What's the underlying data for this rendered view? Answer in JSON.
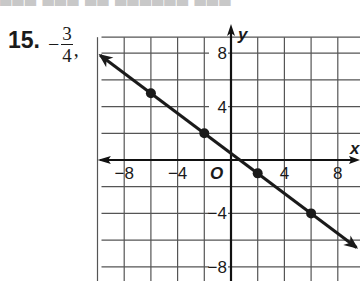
{
  "problem": {
    "number": "15.",
    "answer_sign": "−",
    "answer_numerator": "3",
    "answer_denominator": "4",
    "answer_punct": ","
  },
  "colors": {
    "line": "#1a1a1a",
    "grid": "#555555",
    "axis": "#111111"
  },
  "chart_data": {
    "type": "line",
    "title": "",
    "xlabel": "x",
    "ylabel": "y",
    "origin_label": "O",
    "xlim": [
      -10,
      10
    ],
    "ylim": [
      -10,
      10
    ],
    "grid": true,
    "grid_step": 2,
    "x_ticks": [
      -8,
      -4,
      4,
      8
    ],
    "y_ticks": [
      8,
      4,
      -4,
      -8
    ],
    "x_tick_labels": [
      "−8",
      "−4",
      "4",
      "8"
    ],
    "y_tick_labels": [
      "8",
      "4",
      "−4",
      "−8"
    ],
    "series": [
      {
        "name": "line",
        "slope": -0.75,
        "intercept": 0.5,
        "points": [
          {
            "x": -6,
            "y": 5
          },
          {
            "x": -2,
            "y": 2
          },
          {
            "x": 2,
            "y": -1
          },
          {
            "x": 6,
            "y": -4
          }
        ],
        "arrows_both_ends": true
      }
    ]
  }
}
